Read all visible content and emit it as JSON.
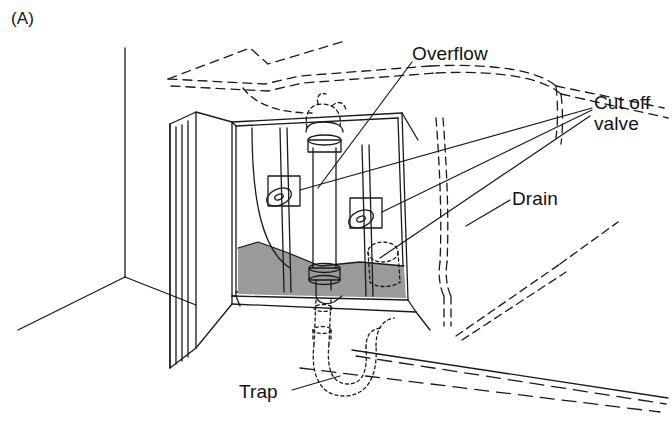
{
  "figure": {
    "panel_tag": "(A)",
    "background_color": "#ffffff",
    "line_color": "#1a1a1a",
    "floor_shade_color": "#9a9a9a"
  },
  "labels": {
    "overflow": "Overflow",
    "cut_off_valve_line1": "Cut off",
    "cut_off_valve_line2": "valve",
    "drain": "Drain",
    "trap": "Trap"
  },
  "components": [
    {
      "name": "overflow-pipe",
      "label": "Overflow",
      "style": "solid",
      "note": "vertical pipe with flanged collar at top"
    },
    {
      "name": "cut-off-valve-left",
      "label": "Cut off valve",
      "style": "solid",
      "note": "oval handle on square escutcheon plate"
    },
    {
      "name": "cut-off-valve-right",
      "label": "Cut off valve",
      "style": "solid",
      "note": "oval handle on square escutcheon plate"
    },
    {
      "name": "drain-pipe",
      "label": "Drain",
      "style": "dashed",
      "note": "hidden drain run behind cabinet"
    },
    {
      "name": "trap",
      "label": "Trap",
      "style": "dotted",
      "note": "P-trap hidden below floor"
    }
  ],
  "leader_lines": [
    {
      "from": "overflow",
      "to": "overflow-pipe"
    },
    {
      "from": "cut_off_valve",
      "to": "cut-off-valve-left"
    },
    {
      "from": "cut_off_valve",
      "to": "cut-off-valve-right"
    },
    {
      "from": "drain",
      "to": "drain-pipe"
    },
    {
      "from": "trap",
      "to": "trap"
    }
  ]
}
